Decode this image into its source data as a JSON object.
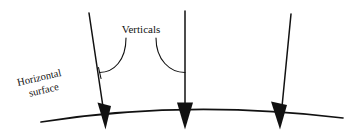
{
  "figure": {
    "type": "line-diagram",
    "background_color": "#ffffff",
    "stroke_color": "#111111",
    "labels": {
      "verticals": "Verticals",
      "horizontal_line1": "Horizontal",
      "horizontal_line2": "surface"
    },
    "geometry": {
      "surface_arc": "M41,122 Q186,99 343,118",
      "verticals": [
        {
          "name": "left-vertical",
          "path": "M89,13 L104,116",
          "tilt": "tilted-right"
        },
        {
          "name": "middle-vertical",
          "path": "M185,11 L185,116",
          "tilt": "upright"
        },
        {
          "name": "right-vertical",
          "path": "M291,14 L281,116",
          "tilt": "tilted-left"
        }
      ],
      "arrowheads": [
        {
          "name": "left-arrowhead",
          "points": "97,103 111,106 105,129"
        },
        {
          "name": "middle-arrowhead",
          "points": "177,103 193,103 185,129"
        },
        {
          "name": "right-arrowhead",
          "points": "271,102 287,105 280,129"
        }
      ],
      "leaders": [
        {
          "name": "left-leader",
          "path": "M126,38 C126,62 112,73 99,73"
        },
        {
          "name": "right-leader",
          "path": "M156,38 C156,62 172,73 185,73"
        }
      ],
      "leader_stubs": [
        {
          "name": "left-leader-stub",
          "path": "M98,68 L98,78"
        }
      ]
    },
    "text_positions": {
      "verticals": {
        "x": 141,
        "y": 33
      },
      "horizontal_surface": {
        "x": 17,
        "y": 86,
        "rotation_deg": -13
      }
    }
  }
}
